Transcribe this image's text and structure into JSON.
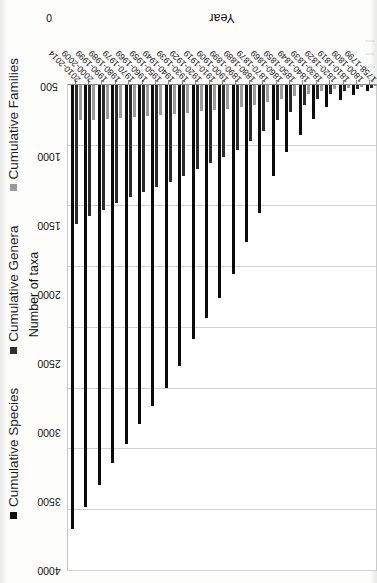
{
  "chart_data": {
    "type": "bar",
    "orientation": "horizontal",
    "title": "",
    "xlabel": "Number of taxa",
    "ylabel": "Year",
    "xlim": [
      0,
      4000
    ],
    "xticks": [
      0,
      500,
      1000,
      1500,
      2000,
      2500,
      3000,
      3500,
      4000
    ],
    "grid": true,
    "legend_position": "bottom",
    "categories": [
      "1758-1799",
      "1800-1809",
      "1810-1819",
      "1820-1829",
      "1830-1839",
      "1840-1849",
      "1850-1859",
      "1860-1869",
      "1870-1879",
      "1880-1889",
      "1890-1899",
      "1900-1909",
      "1910-1919",
      "1920-1929",
      "1930-1939",
      "1940-1949",
      "1950-1959",
      "1960-1969",
      "1970-1979",
      "1980-1989",
      "1990-1999",
      "2000-2009",
      "2010-2014"
    ],
    "series": [
      {
        "name": "Cumulative Species",
        "color": "#0b0b0b",
        "values": [
          60,
          90,
          130,
          190,
          290,
          420,
          560,
          760,
          1060,
          1300,
          1560,
          1760,
          1930,
          2100,
          2320,
          2500,
          2650,
          2800,
          2960,
          3120,
          3300,
          3480,
          3660
        ]
      },
      {
        "name": "Cumulative Genera",
        "color": "#2b2b2b",
        "values": [
          30,
          45,
          60,
          85,
          120,
          175,
          230,
          300,
          390,
          470,
          540,
          600,
          650,
          700,
          760,
          810,
          850,
          890,
          930,
          980,
          1040,
          1090,
          1150
        ]
      },
      {
        "name": "Cumulative Families",
        "color": "#9b9b9b",
        "values": [
          18,
          25,
          32,
          45,
          60,
          80,
          100,
          125,
          150,
          170,
          190,
          205,
          215,
          225,
          238,
          248,
          256,
          263,
          270,
          278,
          286,
          294,
          300
        ]
      }
    ]
  },
  "legend": {
    "items": [
      {
        "label": "Cumulative Species",
        "swatch": "legend-swatch-species"
      },
      {
        "label": "Cumulative Genera",
        "swatch": "legend-swatch-genera"
      },
      {
        "label": "Cumulative Families",
        "swatch": "legend-swatch-families"
      }
    ]
  },
  "axes": {
    "value_axis_title": "Number of taxa",
    "category_axis_title": "Year"
  }
}
